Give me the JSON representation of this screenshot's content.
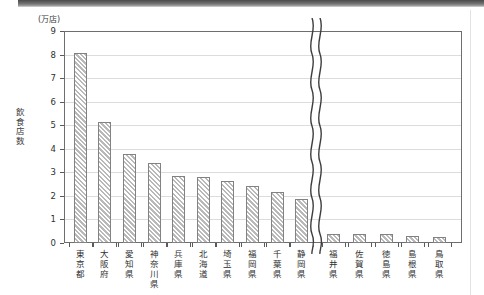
{
  "chart_data": {
    "type": "bar",
    "title": "",
    "subtitle": "",
    "unit_label": "(万店)",
    "ylabel": "飲食店数",
    "ylabel_chars": [
      "飲",
      "食",
      "店",
      "数"
    ],
    "xlabel": "",
    "ylim": [
      0,
      9
    ],
    "ytick_labels": [
      "0",
      "1",
      "2",
      "3",
      "4",
      "5",
      "6",
      "7",
      "8",
      "9"
    ],
    "yticks": [
      0,
      1,
      2,
      3,
      4,
      5,
      6,
      7,
      8,
      9
    ],
    "grid": true,
    "legend": "none",
    "axis_break": {
      "present": true,
      "style": "double-wavy",
      "after_category": "静岡県"
    },
    "categories": [
      "東京都",
      "大阪府",
      "愛知県",
      "神奈川県",
      "兵庫県",
      "北海道",
      "埼玉県",
      "福岡県",
      "千葉県",
      "静岡県",
      "福井県",
      "佐賀県",
      "徳島県",
      "島根県",
      "鳥取県"
    ],
    "category_chars": [
      [
        "東",
        "京",
        "都"
      ],
      [
        "大",
        "阪",
        "府"
      ],
      [
        "愛",
        "知",
        "県"
      ],
      [
        "神",
        "奈",
        "川",
        "県"
      ],
      [
        "兵",
        "庫",
        "県"
      ],
      [
        "北",
        "海",
        "道"
      ],
      [
        "埼",
        "玉",
        "県"
      ],
      [
        "福",
        "岡",
        "県"
      ],
      [
        "千",
        "葉",
        "県"
      ],
      [
        "静",
        "岡",
        "県"
      ],
      [
        "福",
        "井",
        "県"
      ],
      [
        "佐",
        "賀",
        "県"
      ],
      [
        "徳",
        "島",
        "県"
      ],
      [
        "島",
        "根",
        "県"
      ],
      [
        "鳥",
        "取",
        "県"
      ]
    ],
    "values": [
      8.05,
      5.12,
      3.8,
      3.38,
      2.85,
      2.82,
      2.62,
      2.42,
      2.18,
      1.87,
      0.4,
      0.38,
      0.37,
      0.3,
      0.26
    ],
    "bar_fill": "#e3e3e3",
    "bar_hatch": "diagonal-45",
    "bar_border": "#828282",
    "grid_color": "#dcdcdc",
    "axis_color": "#6e6e6e"
  }
}
